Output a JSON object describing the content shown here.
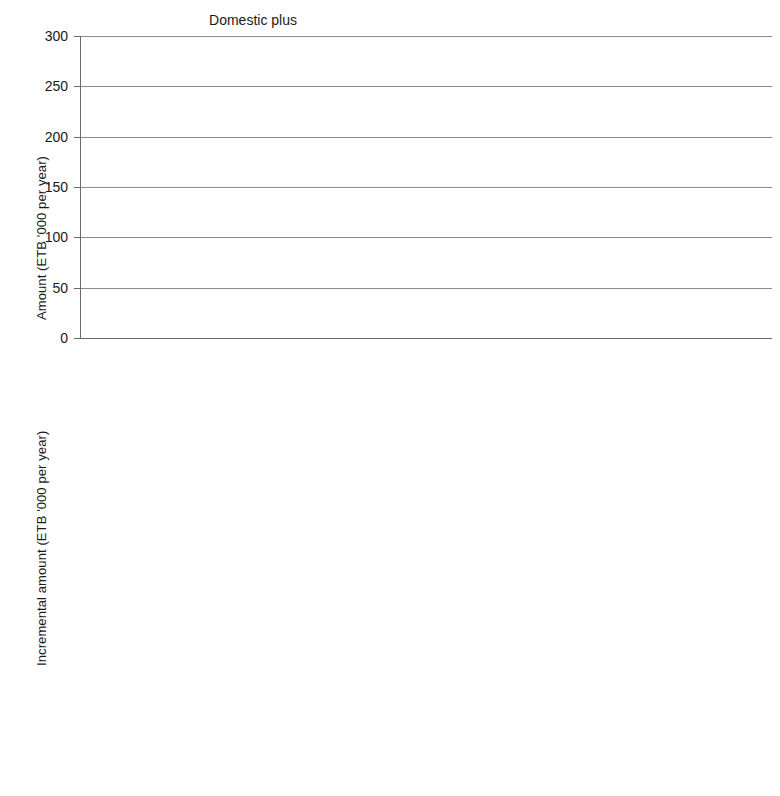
{
  "chart_data": [
    {
      "type": "bar",
      "panel_id": "top",
      "title": "",
      "ylabel": "Amount (ETB '000 per year)",
      "xlabel": "",
      "ylim": [
        0,
        300
      ],
      "yticks": [
        0,
        50,
        100,
        150,
        200,
        250,
        300
      ],
      "ytick_labels": [
        "0",
        "50",
        "100",
        "150",
        "200",
        "250",
        "300"
      ],
      "grid": true,
      "legend_position": "bottom",
      "groups": [
        {
          "name": "Domestic plus",
          "bold": false,
          "categories": [
            "No\nwater services",
            "Water-supply\nservices",
            "MUS"
          ],
          "series": [
            {
              "name": "Benefit",
              "values": [
                0,
                5,
                7
              ]
            },
            {
              "name": "Cost",
              "values": [
                104,
                137,
                157
              ]
            }
          ]
        },
        {
          "name": "Irrigation plus",
          "bold": false,
          "categories": [
            "No\nwater services",
            "Irrigation\nservices",
            "MUS"
          ],
          "series": [
            {
              "name": "Benefit",
              "values": [
                0,
                6,
                7
              ]
            },
            {
              "name": "Cost",
              "values": [
                109,
                185,
                270
              ]
            }
          ]
        }
      ]
    },
    {
      "type": "bar",
      "panel_id": "bottom",
      "title": "",
      "ylabel": "Incremental amount (ETB '000 per year)",
      "xlabel": "",
      "ylim": [
        0,
        250
      ],
      "yticks": [
        0,
        50,
        100,
        150,
        200,
        250
      ],
      "ytick_labels": [
        "0",
        "50",
        "",
        "150",
        "200",
        "250"
      ],
      "grid": true,
      "legend_position": "bottom",
      "groups": [
        {
          "name": "Ido Jalala",
          "bold": true,
          "categories": [
            "Towards\nsingle-use\nwater services",
            "Upgrade\nto MUS",
            "Total"
          ],
          "series": [
            {
              "name": "Benefit",
              "values": [
                4,
                0.5,
                5
              ]
            },
            {
              "name": "Cost",
              "values": [
                31,
                20,
                52
              ]
            }
          ]
        },
        {
          "name": "Ifa Daba",
          "bold": true,
          "categories": [
            "Towards\nsingle-use\nwater services",
            "Upgrade\nto MUS",
            "Total"
          ],
          "series": [
            {
              "name": "Benefit",
              "values": [
                5,
                0.5,
                7
              ]
            },
            {
              "name": "Cost",
              "values": [
                75,
                84,
                208
              ]
            }
          ]
        }
      ]
    }
  ],
  "legend": {
    "items": [
      {
        "label": "Benefit",
        "color": "#565656",
        "key": "benefit"
      },
      {
        "label": "Cost",
        "color": "#dcdcdc",
        "key": "cost"
      }
    ]
  },
  "colors": {
    "benefit": "#6b6b6b",
    "cost": "#d4d4d4",
    "gridline": "#8c8c8c",
    "axis": "#6a6a6a",
    "divider": "#222222",
    "text": "#1a1a1a"
  }
}
